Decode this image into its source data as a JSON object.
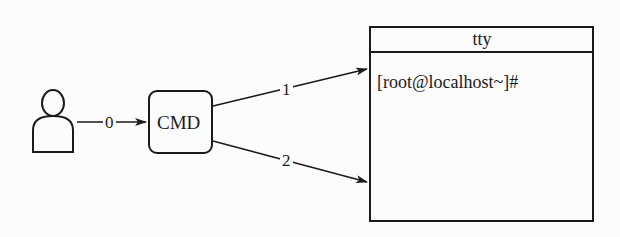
{
  "diagram": {
    "user": {
      "icon": "person-icon"
    },
    "cmd": {
      "label": "CMD"
    },
    "terminal": {
      "title": "tty",
      "prompt": "[root@localhost~]#"
    },
    "edges": [
      {
        "from": "user",
        "to": "cmd",
        "label": "0"
      },
      {
        "from": "cmd",
        "to": "terminal",
        "label": "1"
      },
      {
        "from": "cmd",
        "to": "terminal",
        "label": "2"
      }
    ],
    "colors": {
      "stroke": "#1a1a1a",
      "background": "#fcfcfc"
    }
  }
}
